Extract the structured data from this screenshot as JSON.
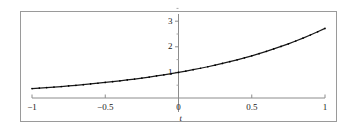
{
  "figure": {
    "background": "#ffffff",
    "frame_color": "#9a9a9a",
    "axis_color": "#8c8c8c",
    "curve_color": "#1a1a1a"
  },
  "chart_data": {
    "type": "line",
    "title": "",
    "subtitle": "",
    "xlabel": "t",
    "ylabel": "",
    "xlim": [
      -1,
      1
    ],
    "ylim": [
      -0.35,
      3.45
    ],
    "grid": false,
    "legend": null,
    "x_ticks": [
      -1,
      -0.5,
      0,
      0.5,
      1
    ],
    "x_tick_labels": [
      "−1",
      "−0.5",
      "0",
      "0.5",
      "1"
    ],
    "y_ticks": [
      1,
      2,
      3
    ],
    "y_tick_labels": [
      "1",
      "2",
      "3"
    ],
    "y_minor_ticks": [
      0.5,
      1.5,
      2.5,
      3.5
    ],
    "x_axis_position": 0,
    "y_axis_position": 0,
    "series": [
      {
        "name": "exp(t)",
        "style": "solid-with-dots",
        "x": [
          -1,
          -0.95,
          -0.9,
          -0.85,
          -0.8,
          -0.75,
          -0.7,
          -0.65,
          -0.6,
          -0.55,
          -0.5,
          -0.45,
          -0.4,
          -0.35,
          -0.3,
          -0.25,
          -0.2,
          -0.15,
          -0.1,
          -0.05,
          0,
          0.05,
          0.1,
          0.15,
          0.2,
          0.25,
          0.3,
          0.35,
          0.4,
          0.45,
          0.5,
          0.55,
          0.6,
          0.65,
          0.7,
          0.75,
          0.8,
          0.85,
          0.9,
          0.95,
          1
        ],
        "y": [
          0.368,
          0.387,
          0.407,
          0.427,
          0.449,
          0.472,
          0.497,
          0.522,
          0.549,
          0.577,
          0.607,
          0.638,
          0.67,
          0.705,
          0.741,
          0.779,
          0.819,
          0.861,
          0.905,
          0.951,
          1.0,
          1.051,
          1.105,
          1.162,
          1.221,
          1.284,
          1.35,
          1.419,
          1.492,
          1.568,
          1.649,
          1.733,
          1.822,
          1.916,
          2.014,
          2.117,
          2.226,
          2.34,
          2.46,
          2.586,
          2.718
        ]
      }
    ]
  }
}
